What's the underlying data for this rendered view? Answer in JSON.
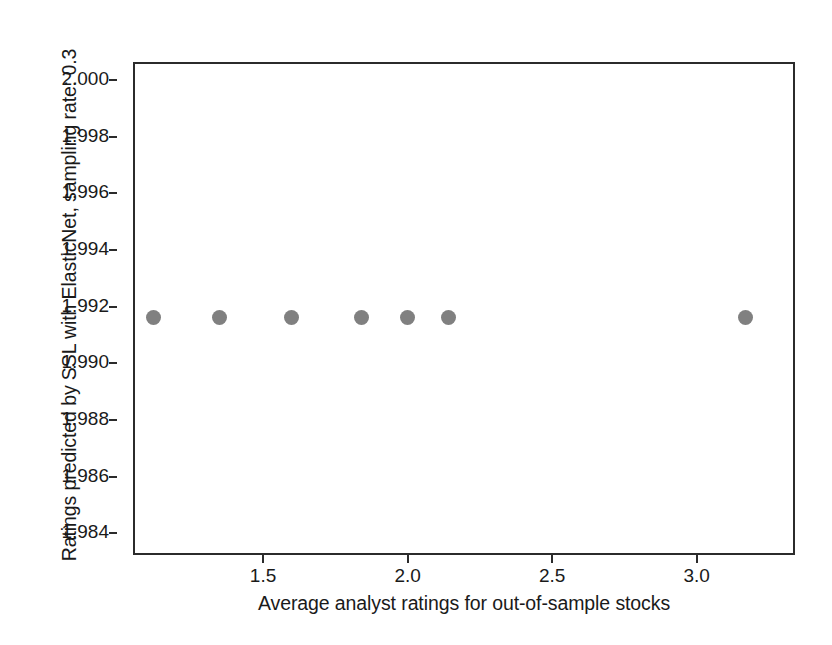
{
  "chart_data": {
    "type": "scatter",
    "title": "",
    "xlabel": "Average analyst ratings for out-of-sample stocks",
    "ylabel": "Ratings predicted by SSL with ElasticNet, sampling rate: 0.3",
    "xlim": [
      1.05,
      3.34
    ],
    "ylim": [
      1.9832,
      2.0006
    ],
    "grid": false,
    "legend": null,
    "marker": {
      "shape": "circle",
      "color": "#808080",
      "size_px": 15
    },
    "xticks": [
      {
        "value": 1.5,
        "label": "1.5"
      },
      {
        "value": 2.0,
        "label": "2.0"
      },
      {
        "value": 2.5,
        "label": "2.5"
      },
      {
        "value": 3.0,
        "label": "3.0"
      }
    ],
    "yticks": [
      {
        "value": 2.0,
        "label": "2.000"
      },
      {
        "value": 1.998,
        "label": "1.998"
      },
      {
        "value": 1.996,
        "label": "1.996"
      },
      {
        "value": 1.994,
        "label": "1.994"
      },
      {
        "value": 1.992,
        "label": "1.992"
      },
      {
        "value": 1.99,
        "label": "1.990"
      },
      {
        "value": 1.988,
        "label": "1.988"
      },
      {
        "value": 1.986,
        "label": "1.986"
      },
      {
        "value": 1.984,
        "label": "1.984"
      }
    ],
    "x": [
      1.12,
      1.35,
      1.6,
      1.84,
      2.0,
      2.14,
      3.17
    ],
    "y": [
      1.9916,
      1.9916,
      1.9916,
      1.9916,
      1.9916,
      1.9916,
      1.9916
    ],
    "points": [
      {
        "x": 1.12,
        "y": 1.9916
      },
      {
        "x": 1.35,
        "y": 1.9916
      },
      {
        "x": 1.6,
        "y": 1.9916
      },
      {
        "x": 1.84,
        "y": 1.9916
      },
      {
        "x": 2.0,
        "y": 1.9916
      },
      {
        "x": 2.14,
        "y": 1.9916
      },
      {
        "x": 3.17,
        "y": 1.9916
      }
    ]
  },
  "axis_colors": {
    "frame": "#2b2b2b",
    "text": "#1a1a1a",
    "background": "#ffffff"
  }
}
